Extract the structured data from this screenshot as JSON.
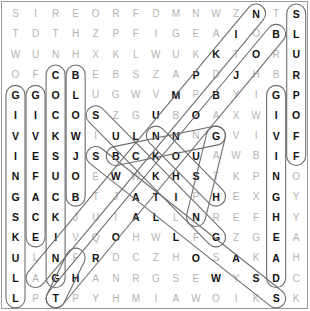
{
  "puzzle": {
    "rows": 15,
    "cols": 15,
    "grid": [
      [
        "S",
        "I",
        "R",
        "E",
        "O",
        "R",
        "F",
        "D",
        "M",
        "N",
        "W",
        "Z",
        "N",
        "T",
        "S"
      ],
      [
        "T",
        "D",
        "T",
        "H",
        "Z",
        "P",
        "F",
        "I",
        "G",
        "E",
        "A",
        "I",
        "O",
        "B",
        "L"
      ],
      [
        "W",
        "U",
        "N",
        "H",
        "X",
        "K",
        "L",
        "W",
        "U",
        "K",
        "K",
        "T",
        "O",
        "R",
        "U"
      ],
      [
        "O",
        "F",
        "C",
        "B",
        "E",
        "B",
        "S",
        "Z",
        "A",
        "P",
        "D",
        "J",
        "H",
        "B",
        "R"
      ],
      [
        "G",
        "G",
        "O",
        "L",
        "U",
        "G",
        "W",
        "V",
        "M",
        "P",
        "B",
        "Y",
        "I",
        "G",
        "P"
      ],
      [
        "I",
        "I",
        "C",
        "O",
        "S",
        "Z",
        "G",
        "U",
        "B",
        "O",
        "A",
        "X",
        "W",
        "I",
        "O"
      ],
      [
        "V",
        "V",
        "K",
        "W",
        "I",
        "U",
        "L",
        "N",
        "N",
        "N",
        "G",
        "V",
        "I",
        "V",
        "F"
      ],
      [
        "I",
        "E",
        "S",
        "J",
        "S",
        "B",
        "C",
        "K",
        "O",
        "U",
        "A",
        "W",
        "B",
        "I",
        "F"
      ],
      [
        "N",
        "F",
        "U",
        "O",
        "E",
        "W",
        "W",
        "K",
        "H",
        "S",
        "T",
        "K",
        "P",
        "N",
        "O"
      ],
      [
        "G",
        "A",
        "C",
        "B",
        "T",
        "J",
        "A",
        "T",
        "I",
        "P",
        "H",
        "E",
        "X",
        "G",
        "Y"
      ],
      [
        "S",
        "C",
        "K",
        "J",
        "U",
        "I",
        "A",
        "L",
        "L",
        "N",
        "R",
        "E",
        "F",
        "H",
        "Y"
      ],
      [
        "K",
        "E",
        "I",
        "V",
        "Q",
        "O",
        "H",
        "W",
        "L",
        "F",
        "G",
        "Z",
        "G",
        "E",
        "A"
      ],
      [
        "U",
        "L",
        "N",
        "F",
        "R",
        "D",
        "C",
        "Z",
        "H",
        "O",
        "S",
        "A",
        "K",
        "A",
        "H"
      ],
      [
        "L",
        "A",
        "G",
        "H",
        "A",
        "N",
        "R",
        "G",
        "S",
        "E",
        "W",
        "Y",
        "S",
        "D",
        "C"
      ],
      [
        "L",
        "P",
        "T",
        "P",
        "Y",
        "H",
        "M",
        "I",
        "A",
        "W",
        "O",
        "I",
        "K",
        "S",
        "K"
      ]
    ],
    "found_words": [
      {
        "word": "GIVINGSKULL",
        "start": [
          4,
          0
        ],
        "end": [
          14,
          0
        ]
      },
      {
        "word": "GIVEFACE",
        "start": [
          4,
          1
        ],
        "end": [
          11,
          1
        ]
      },
      {
        "word": "COCKSUCKING",
        "start": [
          3,
          2
        ],
        "end": [
          13,
          2
        ]
      },
      {
        "word": "BLOWJOB",
        "start": [
          3,
          3
        ],
        "end": [
          9,
          3
        ]
      },
      {
        "word": "GIVINGHEAD",
        "start": [
          4,
          13
        ],
        "end": [
          13,
          13
        ]
      },
      {
        "word": "SLURPOFF",
        "start": [
          0,
          14
        ],
        "end": [
          7,
          14
        ]
      },
      {
        "word": "NIKPMULB",
        "start": [
          0,
          12
        ],
        "end": [
          13,
          1
        ]
      },
      {
        "word": "BOJBON",
        "start": [
          1,
          13
        ],
        "end": [
          14,
          2
        ]
      },
      {
        "word": "SUCKING",
        "start": [
          5,
          4
        ],
        "end": [
          11,
          10
        ]
      },
      {
        "word": "SWALLOWS",
        "start": [
          7,
          4
        ],
        "end": [
          14,
          13
        ]
      },
      {
        "word": "BUNG",
        "start": [
          7,
          5
        ],
        "end": [
          6,
          10
        ]
      },
      {
        "word": "NOSH",
        "start": [
          6,
          7
        ],
        "end": [
          9,
          10
        ]
      },
      {
        "word": "GUN",
        "start": [
          6,
          10
        ],
        "end": [
          10,
          9
        ]
      },
      {
        "word": "HOT",
        "start": [
          12,
          3
        ],
        "end": [
          14,
          2
        ]
      }
    ],
    "highlighted_cells": [
      [
        0,
        12
      ],
      [
        0,
        14
      ],
      [
        1,
        11
      ],
      [
        1,
        13
      ],
      [
        1,
        14
      ],
      [
        2,
        10
      ],
      [
        2,
        12
      ],
      [
        2,
        14
      ],
      [
        3,
        2
      ],
      [
        3,
        3
      ],
      [
        3,
        9
      ],
      [
        3,
        11
      ],
      [
        3,
        14
      ],
      [
        4,
        0
      ],
      [
        4,
        1
      ],
      [
        4,
        2
      ],
      [
        4,
        3
      ],
      [
        4,
        8
      ],
      [
        4,
        10
      ],
      [
        4,
        13
      ],
      [
        4,
        14
      ],
      [
        5,
        0
      ],
      [
        5,
        1
      ],
      [
        5,
        2
      ],
      [
        5,
        3
      ],
      [
        5,
        4
      ],
      [
        5,
        7
      ],
      [
        5,
        9
      ],
      [
        5,
        13
      ],
      [
        5,
        14
      ],
      [
        6,
        0
      ],
      [
        6,
        1
      ],
      [
        6,
        2
      ],
      [
        6,
        3
      ],
      [
        6,
        5
      ],
      [
        6,
        6
      ],
      [
        6,
        7
      ],
      [
        6,
        8
      ],
      [
        6,
        10
      ],
      [
        6,
        13
      ],
      [
        6,
        14
      ],
      [
        7,
        0
      ],
      [
        7,
        1
      ],
      [
        7,
        2
      ],
      [
        7,
        3
      ],
      [
        7,
        4
      ],
      [
        7,
        5
      ],
      [
        7,
        6
      ],
      [
        7,
        7
      ],
      [
        7,
        8
      ],
      [
        7,
        9
      ],
      [
        7,
        13
      ],
      [
        7,
        14
      ],
      [
        8,
        0
      ],
      [
        8,
        1
      ],
      [
        8,
        2
      ],
      [
        8,
        3
      ],
      [
        8,
        5
      ],
      [
        8,
        7
      ],
      [
        8,
        8
      ],
      [
        8,
        9
      ],
      [
        8,
        13
      ],
      [
        9,
        0
      ],
      [
        9,
        1
      ],
      [
        9,
        2
      ],
      [
        9,
        3
      ],
      [
        9,
        6
      ],
      [
        9,
        7
      ],
      [
        9,
        8
      ],
      [
        9,
        10
      ],
      [
        9,
        13
      ],
      [
        10,
        0
      ],
      [
        10,
        1
      ],
      [
        10,
        2
      ],
      [
        10,
        6
      ],
      [
        10,
        7
      ],
      [
        10,
        9
      ],
      [
        10,
        13
      ],
      [
        11,
        0
      ],
      [
        11,
        1
      ],
      [
        11,
        2
      ],
      [
        11,
        5
      ],
      [
        11,
        8
      ],
      [
        11,
        10
      ],
      [
        11,
        13
      ],
      [
        12,
        0
      ],
      [
        12,
        2
      ],
      [
        12,
        4
      ],
      [
        12,
        9
      ],
      [
        12,
        11
      ],
      [
        12,
        13
      ],
      [
        13,
        0
      ],
      [
        13,
        2
      ],
      [
        13,
        3
      ],
      [
        13,
        10
      ],
      [
        13,
        12
      ],
      [
        13,
        13
      ],
      [
        14,
        0
      ],
      [
        14,
        2
      ],
      [
        14,
        13
      ]
    ],
    "colors": {
      "found_letter": "#111111",
      "unfound_letter": "#b4b4b4",
      "pill_outline": "#6e6e6e",
      "border": "#9a9a9a",
      "background": "#ffffff"
    }
  }
}
